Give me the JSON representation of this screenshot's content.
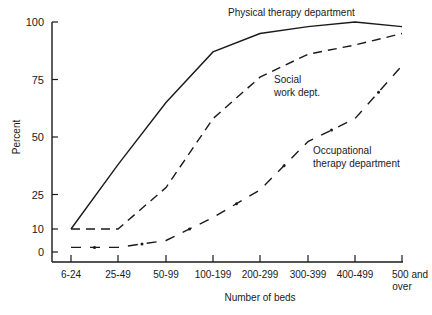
{
  "chart_data": {
    "type": "line",
    "title": "",
    "xlabel": "Number of beds",
    "ylabel": "Percent",
    "categories": [
      "6-24",
      "25-49",
      "50-99",
      "100-199",
      "200-299",
      "300-399",
      "400-499",
      "500 and over"
    ],
    "yticks": [
      0,
      10,
      25,
      50,
      75,
      100
    ],
    "ylim": [
      0,
      100
    ],
    "grid": false,
    "legend": "inline labels",
    "series": [
      {
        "name": "Physical therapy department",
        "style": "solid",
        "values": [
          10,
          38,
          65,
          87,
          95,
          98,
          100,
          98
        ]
      },
      {
        "name": "Social work dept.",
        "style": "dashed",
        "values": [
          10,
          10,
          28,
          58,
          76,
          86,
          90,
          95
        ]
      },
      {
        "name": "Occupational therapy department",
        "style": "dash-dot",
        "values": [
          2,
          2,
          5,
          15,
          27,
          48,
          58,
          81
        ]
      }
    ],
    "annotations": [
      {
        "text": "Physical therapy department",
        "series": 0
      },
      {
        "text": "Social work dept.",
        "lines": [
          "Social",
          "work dept."
        ],
        "series": 1
      },
      {
        "text": "Occupational therapy department",
        "lines": [
          "Occupational",
          "therapy department"
        ],
        "series": 2
      }
    ]
  }
}
